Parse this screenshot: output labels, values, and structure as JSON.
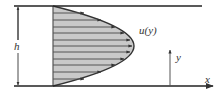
{
  "labels": {
    "height": "h",
    "velocity": "u(y)",
    "y_axis": "y",
    "x_axis": "x"
  },
  "colors": {
    "line": "#222222",
    "fill": "#c9c9c9",
    "stroke_gray": "#555555",
    "text": "#333333"
  },
  "profile": {
    "type": "parabolic",
    "arrow_count": 11
  }
}
